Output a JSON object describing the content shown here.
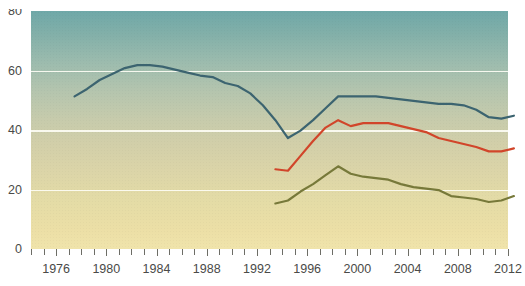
{
  "chart_data": {
    "type": "line",
    "title": "",
    "xlabel": "",
    "ylabel": "",
    "xlim": [
      1974,
      2012
    ],
    "ylim": [
      0,
      80
    ],
    "yticks": [
      0,
      20,
      40,
      60,
      80
    ],
    "xticks": [
      1974,
      1975,
      1976,
      1977,
      1978,
      1979,
      1980,
      1981,
      1982,
      1983,
      1984,
      1985,
      1986,
      1987,
      1988,
      1989,
      1990,
      1991,
      1992,
      1993,
      1994,
      1995,
      1996,
      1997,
      1998,
      1999,
      2000,
      2001,
      2002,
      2003,
      2004,
      2005,
      2006,
      2007,
      2008,
      2009,
      2010,
      2011,
      2012
    ],
    "xticklabels": [
      "1976",
      "1980",
      "1984",
      "1988",
      "1992",
      "1996",
      "2000",
      "2004",
      "2008",
      "2012"
    ],
    "xticklabel_years": [
      1976,
      1980,
      1984,
      1988,
      1992,
      1996,
      2000,
      2004,
      2008,
      2012
    ],
    "grid": "horizontal",
    "legend": "none",
    "background": "vertical gradient teal to pale yellow",
    "series": [
      {
        "name": "series-teal",
        "color": "#3c6470",
        "x": [
          1975,
          1976,
          1977,
          1978,
          1979,
          1980,
          1981,
          1982,
          1983,
          1984,
          1985,
          1986,
          1987,
          1988,
          1989,
          1990,
          1991,
          1992,
          1993,
          1994,
          1995,
          1996,
          1997,
          1998,
          1999,
          2000,
          2001,
          2002,
          2003,
          2004,
          2005,
          2006,
          2007,
          2008,
          2009,
          2010
        ],
        "y": [
          55.0,
          57.5,
          60.5,
          62.5,
          64.5,
          65.5,
          65.5,
          65.0,
          64.0,
          63.0,
          62.0,
          61.5,
          59.5,
          58.5,
          56.0,
          52.0,
          47.0,
          41.0,
          43.5,
          47.0,
          51.0,
          55.0,
          55.0,
          55.0,
          55.0,
          54.5,
          54.0,
          53.5,
          53.0,
          52.5,
          52.5,
          52.0,
          50.5,
          48.0,
          47.5,
          48.5
        ]
      },
      {
        "name": "series-red",
        "color": "#d1452a",
        "x": [
          1991,
          1992,
          1993,
          1994,
          1995,
          1996,
          1997,
          1998,
          1999,
          2000,
          2001,
          2002,
          2003,
          2004,
          2005,
          2006,
          2007,
          2008,
          2009,
          2010
        ],
        "y": [
          30.5,
          30.0,
          35.0,
          40.0,
          44.5,
          47.0,
          45.0,
          46.0,
          46.0,
          46.0,
          45.0,
          44.0,
          43.0,
          41.0,
          40.0,
          39.0,
          38.0,
          36.5,
          36.5,
          37.5
        ]
      },
      {
        "name": "series-olive",
        "color": "#77793a",
        "x": [
          1991,
          1992,
          1993,
          1994,
          1995,
          1996,
          1997,
          1998,
          1999,
          2000,
          2001,
          2002,
          2003,
          2004,
          2005,
          2006,
          2007,
          2008,
          2009,
          2010
        ],
        "y": [
          19.0,
          20.0,
          23.0,
          25.5,
          28.5,
          31.5,
          29.0,
          28.0,
          27.5,
          27.0,
          25.5,
          24.5,
          24.0,
          23.5,
          21.5,
          21.0,
          20.5,
          19.5,
          20.0,
          21.5
        ]
      }
    ]
  },
  "axis": {
    "y_tick_labels": [
      "80",
      "60",
      "40",
      "20",
      "0"
    ],
    "y_tick_values": [
      80,
      60,
      40,
      20,
      0
    ]
  },
  "top_crop": {
    "text": ""
  }
}
